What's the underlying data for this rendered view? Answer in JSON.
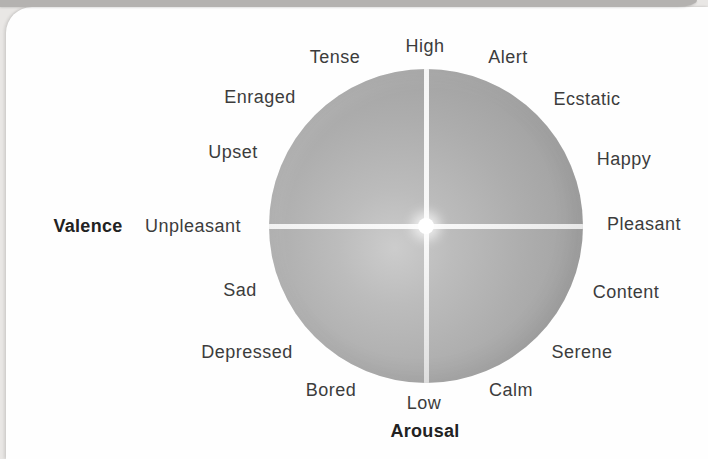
{
  "diagram": {
    "type": "circumplex-model-of-affect",
    "axes": {
      "horizontal_name": "Valence",
      "horizontal_left": "Unpleasant",
      "horizontal_right": "Pleasant",
      "vertical_name": "Arousal",
      "vertical_high": "High",
      "vertical_low": "Low"
    },
    "circle": {
      "cx": 426,
      "cy": 226,
      "r": 157
    },
    "labels": [
      {
        "text": "High",
        "x": 425,
        "y": 46,
        "bold": false,
        "name": "axis-high-label"
      },
      {
        "text": "Tense",
        "x": 335,
        "y": 57,
        "bold": false,
        "name": "emotion-tense-label"
      },
      {
        "text": "Alert",
        "x": 508,
        "y": 57,
        "bold": false,
        "name": "emotion-alert-label"
      },
      {
        "text": "Enraged",
        "x": 260,
        "y": 97,
        "bold": false,
        "name": "emotion-enraged-label"
      },
      {
        "text": "Ecstatic",
        "x": 587,
        "y": 99,
        "bold": false,
        "name": "emotion-ecstatic-label"
      },
      {
        "text": "Upset",
        "x": 233,
        "y": 152,
        "bold": false,
        "name": "emotion-upset-label"
      },
      {
        "text": "Happy",
        "x": 624,
        "y": 159,
        "bold": false,
        "name": "emotion-happy-label"
      },
      {
        "text": "Valence",
        "x": 88,
        "y": 226,
        "bold": true,
        "name": "axis-valence-label"
      },
      {
        "text": "Unpleasant",
        "x": 193,
        "y": 226,
        "bold": false,
        "name": "axis-unpleasant-label"
      },
      {
        "text": "Pleasant",
        "x": 644,
        "y": 224,
        "bold": false,
        "name": "axis-pleasant-label"
      },
      {
        "text": "Sad",
        "x": 240,
        "y": 290,
        "bold": false,
        "name": "emotion-sad-label"
      },
      {
        "text": "Content",
        "x": 626,
        "y": 292,
        "bold": false,
        "name": "emotion-content-label"
      },
      {
        "text": "Depressed",
        "x": 247,
        "y": 352,
        "bold": false,
        "name": "emotion-depressed-label"
      },
      {
        "text": "Serene",
        "x": 582,
        "y": 352,
        "bold": false,
        "name": "emotion-serene-label"
      },
      {
        "text": "Bored",
        "x": 331,
        "y": 390,
        "bold": false,
        "name": "emotion-bored-label"
      },
      {
        "text": "Calm",
        "x": 511,
        "y": 390,
        "bold": false,
        "name": "emotion-calm-label"
      },
      {
        "text": "Low",
        "x": 424,
        "y": 403,
        "bold": false,
        "name": "axis-low-label"
      },
      {
        "text": "Arousal",
        "x": 425,
        "y": 431,
        "bold": true,
        "name": "axis-arousal-label"
      }
    ],
    "colors": {
      "page_bg": "#e9e7e5",
      "card_bg": "#fefefe",
      "top_strip": "#b4b2b0",
      "circle_edge": "#999999",
      "circle_mid": "#adadad",
      "circle_light_center": "#cccccc",
      "axis_line": "#fafafa",
      "center_dot": "#ffffff",
      "label_text": "#3c3c3c",
      "bold_label_text": "#222222"
    }
  }
}
